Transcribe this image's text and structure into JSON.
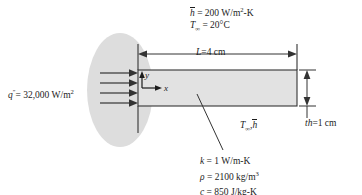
{
  "figure": {
    "type": "engineering-schematic"
  },
  "annotations": {
    "convection": {
      "h_symbol": "h",
      "h_value": "= 200 W/m",
      "h_unit_exp": "2",
      "h_unit_tail": "-K",
      "tinf_symbol": "T",
      "tinf_sub": "∞",
      "tinf_value": "= 20°C"
    },
    "flux": {
      "symbol": "q",
      "primes": "″",
      "value": "= 32,000 W/m",
      "unit_exp": "2"
    },
    "length": {
      "symbol": "L",
      "value": "=4 cm"
    },
    "thickness": {
      "symbol": "th",
      "value": "=1 cm"
    },
    "surface": {
      "tinf_symbol": "T",
      "tinf_sub": "∞",
      "comma": ",",
      "h_symbol": "h"
    },
    "properties": [
      {
        "symbol": "k",
        "value": "= 1 W/m-K",
        "exp": ""
      },
      {
        "symbol": "ρ",
        "value": "= 2100 kg/m",
        "exp": "3"
      },
      {
        "symbol": "c",
        "value": "= 850 J/kg-K",
        "exp": ""
      }
    ],
    "axes": {
      "y_label": "y",
      "x_label": "x"
    }
  },
  "geometry": {
    "slab": {
      "x": 138,
      "y": 70,
      "width": 159,
      "height": 36
    },
    "blob": {
      "cx": 120,
      "cy": 90,
      "rx": 32,
      "ry": 56
    },
    "flux_arrows_y": [
      73,
      83,
      93,
      103
    ],
    "dimension_line_y": 54,
    "thickness_dim_x": 307
  },
  "colors": {
    "slab_fill": "#e2e2e2",
    "blob_fill": "#dddddd",
    "stroke": "#333333",
    "text": "#1c1c1c",
    "background": "#ffffff"
  }
}
